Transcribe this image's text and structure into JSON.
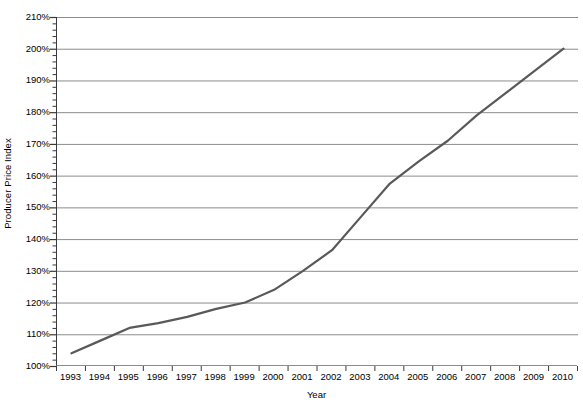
{
  "chart_data": {
    "type": "line",
    "title": "",
    "xlabel": "Year",
    "ylabel": "Producer Price Index",
    "x": [
      1993,
      1994,
      1995,
      1996,
      1997,
      1998,
      1999,
      2000,
      2001,
      2002,
      2003,
      2004,
      2005,
      2006,
      2007,
      2008,
      2009,
      2010
    ],
    "categories": [
      "1993",
      "1994",
      "1995",
      "1996",
      "1997",
      "1998",
      "1999",
      "2000",
      "2001",
      "2002",
      "2003",
      "2004",
      "2005",
      "2006",
      "2007",
      "2008",
      "2009",
      "2010"
    ],
    "series": [
      {
        "name": "Producer Price Index",
        "values": [
          104,
          108,
          112,
          113.5,
          115.5,
          118,
          120,
          124,
          130,
          136.5,
          147,
          157.5,
          164.5,
          171,
          179,
          186,
          193,
          200
        ],
        "color": "#595959",
        "line_width": 2.2
      }
    ],
    "ylim": [
      100,
      210
    ],
    "y_major_step": 10,
    "y_minor_step": 2,
    "y_tick_labels": [
      "100%",
      "110%",
      "120%",
      "130%",
      "140%",
      "150%",
      "160%",
      "170%",
      "180%",
      "190%",
      "200%",
      "210%"
    ],
    "y_tick_values": [
      100,
      110,
      120,
      130,
      140,
      150,
      160,
      170,
      180,
      190,
      200,
      210
    ],
    "grid": {
      "horizontal": true,
      "vertical": false,
      "color": "#8c8c8c"
    },
    "legend": {
      "visible": false,
      "position": "none"
    },
    "axis_color": "#3a3a3a",
    "background": "#ffffff"
  }
}
